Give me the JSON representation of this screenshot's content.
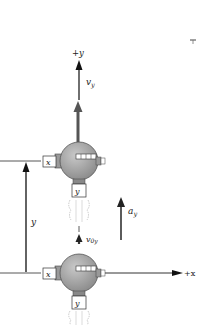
{
  "diagram": {
    "type": "projectile-motion-spacecraft-vertical",
    "axes": {
      "y_axis_label": "+y",
      "x_axis_label": "+x"
    },
    "vectors": {
      "velocity_label": "v",
      "velocity_subscript": "y",
      "initial_velocity_label": "v",
      "initial_velocity_subscript": "0y",
      "acceleration_label": "a",
      "acceleration_subscript": "y",
      "displacement_label": "y"
    },
    "spacecraft": {
      "x_thruster_label": "x",
      "y_thruster_label": "y"
    },
    "colors": {
      "sphere": "#a9a9a9",
      "sphere_dark": "#7c7c7c",
      "velocity_arrow": "#555555",
      "axis": "#333333",
      "exhaust": "#bdbdbd"
    }
  }
}
